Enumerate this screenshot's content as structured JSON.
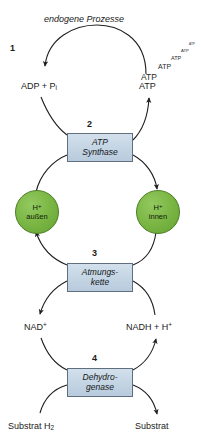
{
  "diagram": {
    "title": "endogene Prozesse",
    "background_color": "#ffffff",
    "line_color": "#1f1f1f",
    "box_fill_color": "#c3d4e3",
    "box_border_color": "#5f6f7e",
    "circle_fill_color": "#7cb745",
    "circle_border_color": "#4b7c22",
    "steps": [
      {
        "number": "1",
        "label": "endogene Prozesse"
      },
      {
        "number": "2",
        "label_line1": "ATP",
        "label_line2": "Synthase"
      },
      {
        "number": "3",
        "label_line1": "Atmungs-",
        "label_line2": "kette"
      },
      {
        "number": "4",
        "label_line1": "Dehydro-",
        "label_line2": "genase"
      }
    ],
    "nodes": {
      "adp_pi": {
        "text": "ADP + P",
        "subscript": "i"
      },
      "atp": {
        "text": "ATP"
      },
      "h_outside": {
        "ion": "H",
        "charge": "+",
        "location": "außen"
      },
      "h_inside": {
        "ion": "H",
        "charge": "+",
        "location": "innen"
      },
      "nad_plus": {
        "text": "NAD",
        "charge": "+"
      },
      "nadh": {
        "text": "NADH + H",
        "charge": "+"
      },
      "substrat_h2": {
        "text": "Substrat H",
        "subscript": "2"
      },
      "substrat": {
        "text": "Substrat"
      }
    },
    "atp_cascade": [
      {
        "label": "ATP",
        "size": 8.5,
        "x": 141,
        "y": 73
      },
      {
        "label": "ATP",
        "size": 7.0,
        "x": 157,
        "y": 63
      },
      {
        "label": "ATP",
        "size": 5.5,
        "x": 170,
        "y": 54
      },
      {
        "label": "ATP",
        "size": 4.2,
        "x": 181,
        "y": 47
      },
      {
        "label": "ATP",
        "size": 3.2,
        "x": 189,
        "y": 41
      }
    ]
  }
}
